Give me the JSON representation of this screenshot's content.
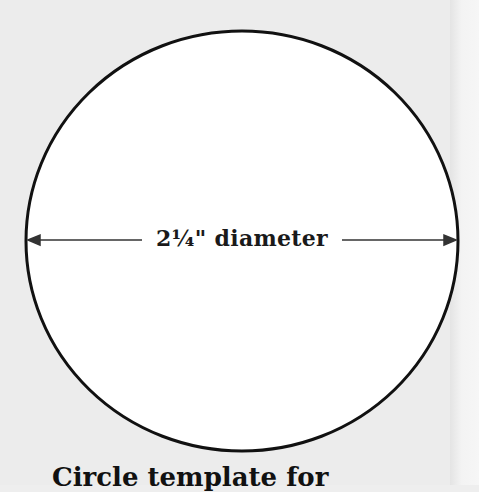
{
  "diagram": {
    "shape": "circle",
    "measurement_label": "2¼\" diameter",
    "caption": "Circle template for",
    "colors": {
      "background": "#ececec",
      "circle_fill": "#ffffff",
      "circle_stroke": "#111111",
      "arrow": "#333333"
    }
  }
}
